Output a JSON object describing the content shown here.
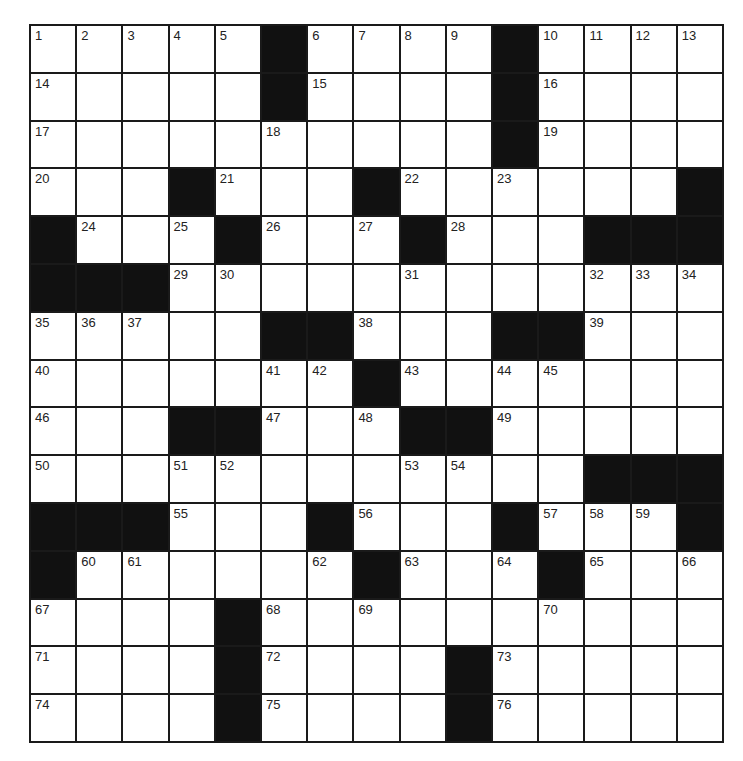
{
  "puzzle": {
    "rows": 15,
    "cols": 15,
    "colors": {
      "block": "#111111",
      "cell": "#ffffff",
      "grid_line": "#1a1a1a",
      "number": "#222222"
    },
    "grid": [
      [
        "1",
        "2",
        "3",
        "4",
        "5",
        "#",
        "6",
        "7",
        "8",
        "9",
        "#",
        "10",
        "11",
        "12",
        "13"
      ],
      [
        "14",
        ".",
        ".",
        ".",
        ".",
        "#",
        "15",
        ".",
        ".",
        ".",
        "#",
        "16",
        ".",
        ".",
        "."
      ],
      [
        "17",
        ".",
        ".",
        ".",
        ".",
        "18",
        ".",
        ".",
        ".",
        ".",
        "#",
        "19",
        ".",
        ".",
        "."
      ],
      [
        "20",
        ".",
        ".",
        "#",
        "21",
        ".",
        ".",
        "#",
        "22",
        ".",
        "23",
        ".",
        ".",
        ".",
        "#"
      ],
      [
        "#",
        "24",
        ".",
        "25",
        "#",
        "26",
        ".",
        "27",
        "#",
        "28",
        ".",
        ".",
        "#",
        "#",
        "#"
      ],
      [
        "#",
        "#",
        "#",
        "29",
        "30",
        ".",
        ".",
        ".",
        "31",
        ".",
        ".",
        ".",
        "32",
        "33",
        "34"
      ],
      [
        "35",
        "36",
        "37",
        ".",
        ".",
        "#",
        "#",
        "38",
        ".",
        ".",
        "#",
        "#",
        "39",
        ".",
        "."
      ],
      [
        "40",
        ".",
        ".",
        ".",
        ".",
        "41",
        "42",
        "#",
        "43",
        ".",
        "44",
        "45",
        ".",
        ".",
        "."
      ],
      [
        "46",
        ".",
        ".",
        "#",
        "#",
        "47",
        ".",
        "48",
        "#",
        "#",
        "49",
        ".",
        ".",
        ".",
        "."
      ],
      [
        "50",
        ".",
        ".",
        "51",
        "52",
        ".",
        ".",
        ".",
        "53",
        "54",
        ".",
        ".",
        "#",
        "#",
        "#"
      ],
      [
        "#",
        "#",
        "#",
        "55",
        ".",
        ".",
        "#",
        "56",
        ".",
        ".",
        "#",
        "57",
        "58",
        "59",
        "#"
      ],
      [
        "#",
        "60",
        "61",
        ".",
        ".",
        ".",
        "62",
        "#",
        "63",
        ".",
        "64",
        "#",
        "65",
        ".",
        "66"
      ],
      [
        "67",
        ".",
        ".",
        ".",
        "#",
        "68",
        ".",
        "69",
        ".",
        ".",
        ".",
        "70",
        ".",
        ".",
        "."
      ],
      [
        "71",
        ".",
        ".",
        ".",
        "#",
        "72",
        ".",
        ".",
        ".",
        "#",
        "73",
        ".",
        ".",
        ".",
        "."
      ],
      [
        "74",
        ".",
        ".",
        ".",
        "#",
        "75",
        ".",
        ".",
        ".",
        "#",
        "76",
        ".",
        ".",
        ".",
        "."
      ]
    ]
  }
}
